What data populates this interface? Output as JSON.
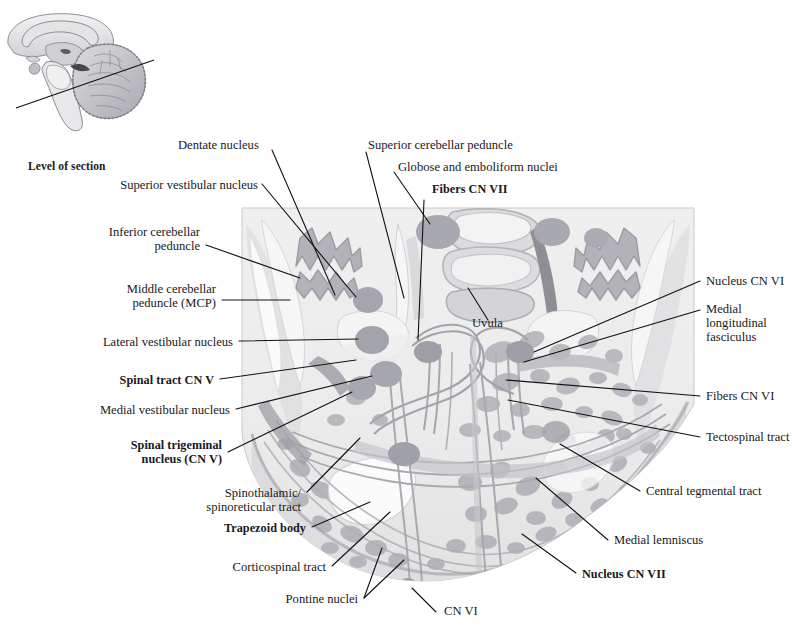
{
  "header": {
    "running_title": "Pons: Level of the Genu of the Facial Nerve"
  },
  "inset": {
    "name": "midsagittal-brain",
    "caption": "Level of section"
  },
  "figure": {
    "name": "pons-cross-section",
    "labels": [
      {
        "id": "dentate-nucleus",
        "text": "Dentate nucleus",
        "bold": false,
        "align": "left"
      },
      {
        "id": "superior-cerebellar-peduncle",
        "text": "Superior cerebellar peduncle",
        "bold": false,
        "align": "left"
      },
      {
        "id": "globose-emboliform-nuclei",
        "text": "Globose and emboliform nuclei",
        "bold": false,
        "align": "left"
      },
      {
        "id": "fibers-cn-vii",
        "text": "Fibers CN VII",
        "bold": true,
        "align": "left"
      },
      {
        "id": "superior-vestibular-nucleus",
        "text": "Superior vestibular nucleus",
        "bold": false,
        "align": "right"
      },
      {
        "id": "inferior-cerebellar-peduncle",
        "text": "Inferior cerebellar\npeduncle",
        "bold": false,
        "align": "right"
      },
      {
        "id": "middle-cerebellar-peduncle",
        "text": "Middle cerebellar\npeduncle (MCP)",
        "bold": false,
        "align": "right"
      },
      {
        "id": "lateral-vestibular-nucleus",
        "text": "Lateral vestibular nucleus",
        "bold": false,
        "align": "right"
      },
      {
        "id": "spinal-tract-cn-v",
        "text": "Spinal tract CN V",
        "bold": true,
        "align": "right"
      },
      {
        "id": "medial-vestibular-nucleus",
        "text": "Medial vestibular nucleus",
        "bold": false,
        "align": "right"
      },
      {
        "id": "spinal-trigeminal-nucleus",
        "text": "Spinal trigeminal\nnucleus (CN V)",
        "bold": true,
        "align": "right"
      },
      {
        "id": "spinothalamic-spinoreticular",
        "text": "Spinothalamic/\nspinoreticular tract",
        "bold": false,
        "align": "right"
      },
      {
        "id": "trapezoid-body",
        "text": "Trapezoid body",
        "bold": true,
        "align": "right"
      },
      {
        "id": "corticospinal-tract",
        "text": "Corticospinal tract",
        "bold": false,
        "align": "right"
      },
      {
        "id": "pontine-nuclei",
        "text": "Pontine nuclei",
        "bold": false,
        "align": "right"
      },
      {
        "id": "cn-vi",
        "text": "CN VI",
        "bold": false,
        "align": "left"
      },
      {
        "id": "uvula",
        "text": "Uvula",
        "bold": false,
        "align": "left"
      },
      {
        "id": "nucleus-cn-vi",
        "text": "Nucleus CN VI",
        "bold": false,
        "align": "left"
      },
      {
        "id": "medial-longitudinal-fasciculus",
        "text": "Medial\nlongitudinal\nfasciculus",
        "bold": false,
        "align": "left"
      },
      {
        "id": "fibers-cn-vi",
        "text": "Fibers CN VI",
        "bold": false,
        "align": "left"
      },
      {
        "id": "tectospinal-tract",
        "text": "Tectospinal tract",
        "bold": false,
        "align": "left"
      },
      {
        "id": "central-tegmental-tract",
        "text": "Central tegmental tract",
        "bold": false,
        "align": "left"
      },
      {
        "id": "medial-lemniscus",
        "text": "Medial lemniscus",
        "bold": false,
        "align": "left"
      },
      {
        "id": "nucleus-cn-vii",
        "text": "Nucleus CN VII",
        "bold": true,
        "align": "left"
      }
    ]
  },
  "colors": {
    "leader_line": "#111111",
    "section_background": "#eeeeee",
    "gray_matter": "#b9b9bd",
    "gray_matter_dark": "#9b9ba2",
    "white_matter": "#f4f4f4",
    "tract_line": "#b4b4ba",
    "text": "#18181c"
  }
}
